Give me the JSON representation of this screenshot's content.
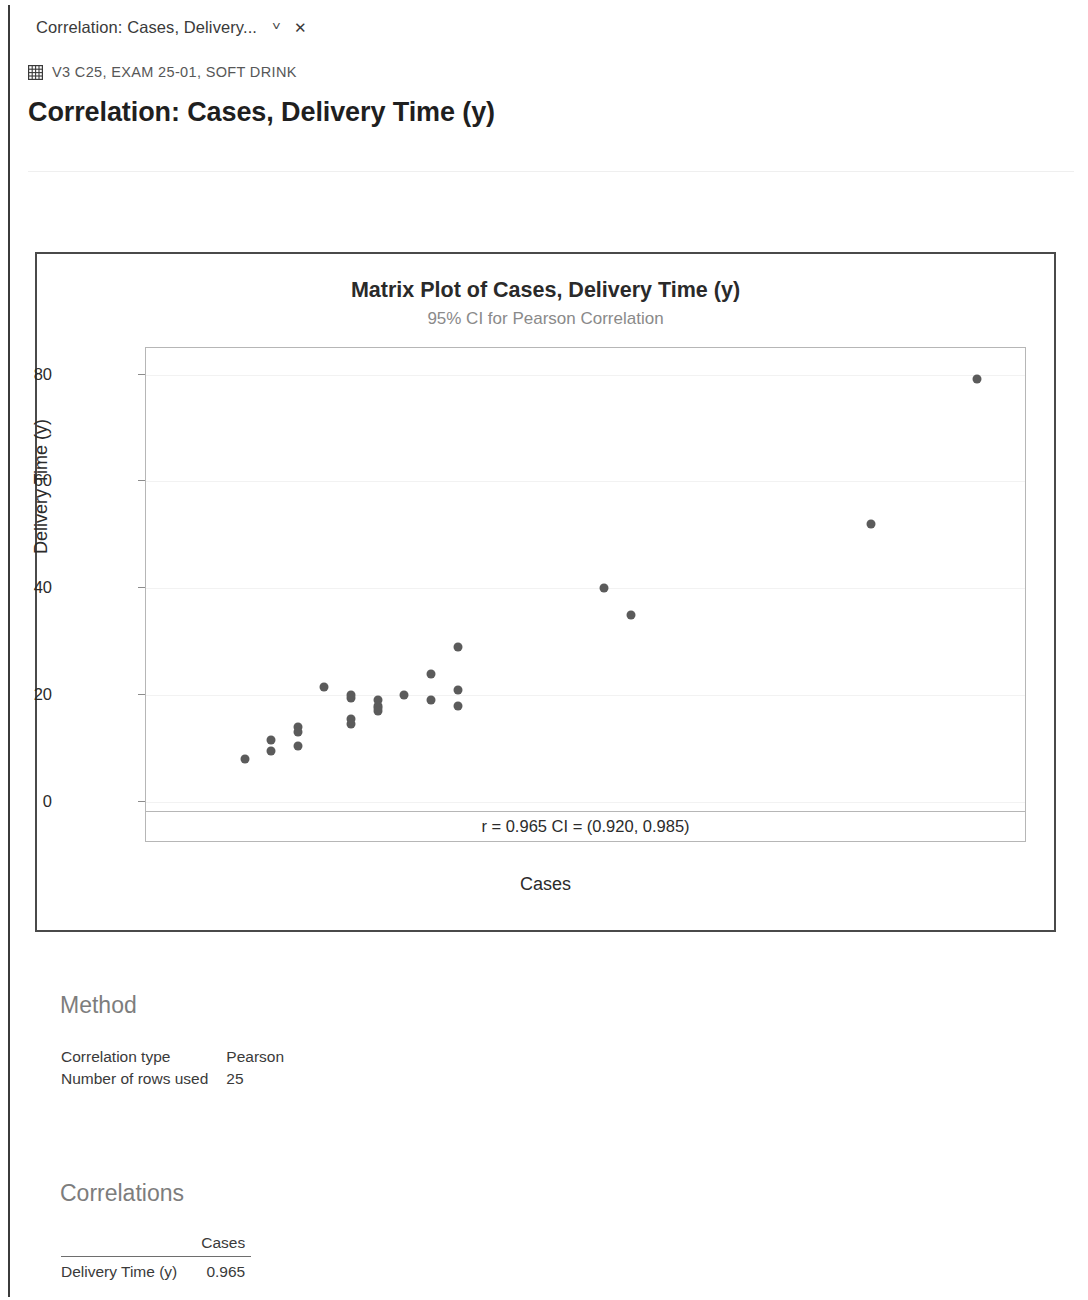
{
  "window": {
    "tab": {
      "label": "Correlation: Cases, Delivery...",
      "caret_icon": "chevron-down-icon",
      "close_icon": "close-icon"
    }
  },
  "breadcrumb": {
    "icon": "worksheet-grid-icon",
    "text": "V3 C25, EXAM 25-01, SOFT DRINK"
  },
  "page": {
    "title": "Correlation: Cases, Delivery Time (y)"
  },
  "sections": {
    "method": {
      "heading": "Method",
      "rows": [
        {
          "key": "Correlation type",
          "value": "Pearson"
        },
        {
          "key": "Number of rows used",
          "value": "25"
        }
      ]
    },
    "correlations": {
      "heading": "Correlations",
      "col_header": "Cases",
      "row_label": "Delivery Time (y)",
      "row_value": "0.965"
    }
  },
  "chart_data": {
    "type": "scatter",
    "title": "Matrix Plot of Cases, Delivery Time (y)",
    "subtitle": "95% CI for Pearson Correlation",
    "xlabel": "Cases",
    "ylabel": "Delivery Time (y)",
    "xlim": [
      -1.2,
      31.8
    ],
    "ylim": [
      -2.5,
      85.0
    ],
    "xticks": [
      0,
      10,
      20,
      30
    ],
    "yticks": [
      0,
      20,
      40,
      60,
      80
    ],
    "grid": true,
    "annotation": "r = 0.965  CI = (0.920, 0.985)",
    "r": 0.965,
    "ci_lower": 0.92,
    "ci_upper": 0.985,
    "n": 25,
    "marker_color": "#5b5b5b",
    "x": [
      2.5,
      3.5,
      3.5,
      4.5,
      4.5,
      4.5,
      5.5,
      6.5,
      6.5,
      6.5,
      7.5,
      7.5,
      7.5,
      7.5,
      8.5,
      9.5,
      9.5,
      10.5,
      10.5,
      10.5,
      16.0,
      17.0,
      26.0,
      30.0,
      6.5
    ],
    "y": [
      8.0,
      11.5,
      9.5,
      14.0,
      13.0,
      10.5,
      21.5,
      19.5,
      15.5,
      14.5,
      19.0,
      18.0,
      17.5,
      17.0,
      20.0,
      24.0,
      19.0,
      29.0,
      21.0,
      18.0,
      40.0,
      35.0,
      52.0,
      79.2,
      20.0
    ]
  }
}
